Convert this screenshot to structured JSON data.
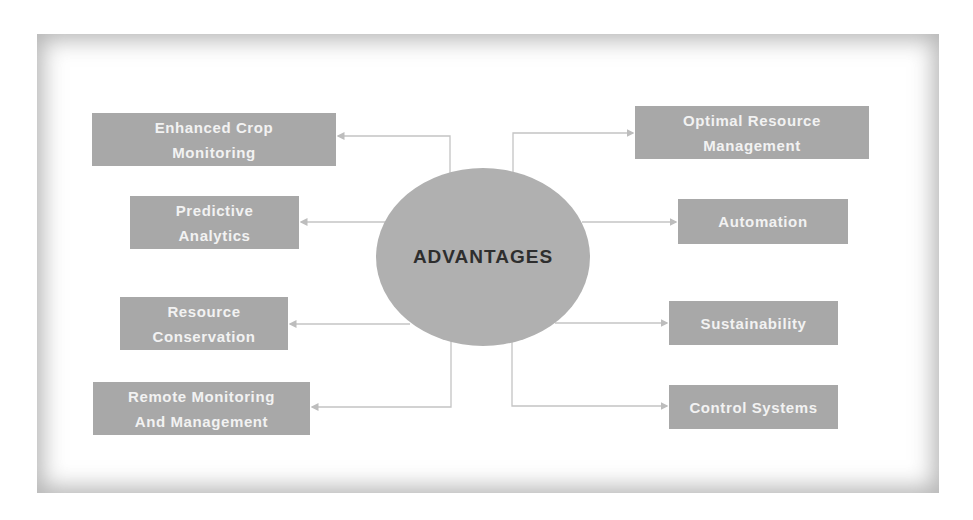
{
  "diagram": {
    "center": {
      "label": "ADVANTAGES"
    },
    "left_items": [
      {
        "line1": "Enhanced Crop",
        "line2": "Monitoring"
      },
      {
        "line1": "Predictive",
        "line2": "Analytics"
      },
      {
        "line1": "Resource",
        "line2": "Conservation"
      },
      {
        "line1": "Remote Monitoring",
        "line2": "And Management"
      }
    ],
    "right_items": [
      {
        "line1": "Optimal Resource",
        "line2": "Management"
      },
      {
        "line1": "Automation",
        "line2": ""
      },
      {
        "line1": "Sustainability",
        "line2": ""
      },
      {
        "line1": "Control Systems",
        "line2": ""
      }
    ],
    "colors": {
      "box_fill": "#a8a8a8",
      "box_text": "#f2f2f2",
      "center_fill": "#b0b0b0",
      "center_text": "#2e2e2e",
      "connector": "#bdbdbd"
    }
  }
}
